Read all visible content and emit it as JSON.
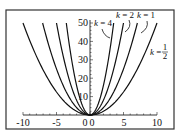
{
  "chart_data": {
    "type": "line",
    "title": "",
    "xlabel": "",
    "ylabel": "",
    "xlim": [
      -10,
      10
    ],
    "ylim": [
      0,
      50
    ],
    "grid": false,
    "legend_position": "none (inline annotations)",
    "function": "y = k x^2",
    "x_ticks": [
      -10,
      -5,
      0,
      5,
      10
    ],
    "x_tick_labels": [
      "-10",
      "-5",
      "0",
      "5",
      "10"
    ],
    "y_ticks": [
      10,
      20,
      30,
      40,
      50
    ],
    "y_tick_labels": [
      "10",
      "20",
      "30",
      "40",
      "50"
    ],
    "series": [
      {
        "name": "k = 4",
        "k": 4,
        "x": [
          -3.54,
          -2.5,
          -1.5,
          0,
          1.5,
          2.5,
          3.54
        ],
        "y": [
          50,
          25,
          9,
          0,
          9,
          25,
          50
        ]
      },
      {
        "name": "k = 2",
        "k": 2,
        "x": [
          -5,
          -3,
          -1,
          0,
          1,
          3,
          5
        ],
        "y": [
          50,
          18,
          2,
          0,
          2,
          18,
          50
        ]
      },
      {
        "name": "k = 1",
        "k": 1,
        "x": [
          -7.07,
          -5,
          -2,
          0,
          2,
          5,
          7.07
        ],
        "y": [
          50,
          25,
          4,
          0,
          4,
          25,
          50
        ]
      },
      {
        "name": "k = 1/2",
        "k": 0.5,
        "x": [
          -10,
          -6,
          -2,
          0,
          2,
          6,
          10
        ],
        "y": [
          50,
          18,
          2,
          0,
          2,
          18,
          50
        ]
      }
    ],
    "annotations": [
      {
        "text": "k = 4",
        "target": "k = 4"
      },
      {
        "text": "k = 2",
        "target": "k = 2"
      },
      {
        "text": "k = 1",
        "target": "k = 1"
      },
      {
        "text": "k = 1/2",
        "target": "k = 1/2"
      }
    ]
  },
  "labels": {
    "k4": {
      "k": "k",
      "eq": " = 4"
    },
    "k2": {
      "k": "k",
      "eq": " = 2"
    },
    "k1": {
      "k": "k",
      "eq": " = 1"
    },
    "khalf": {
      "k": "k",
      "eq": " = ",
      "num": "1",
      "den": "2"
    }
  },
  "ticks": {
    "x": [
      "-10",
      "-5",
      "0",
      "5",
      "10"
    ],
    "y": [
      "10",
      "20",
      "30",
      "40",
      "50"
    ],
    "origin_y": "0"
  }
}
